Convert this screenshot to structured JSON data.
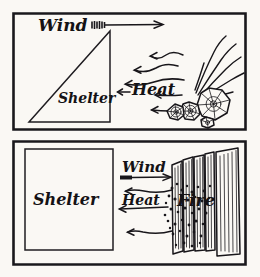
{
  "figure": {
    "background_color": "#faf8f4",
    "ink_color": "#18161a",
    "panel_count": 2
  },
  "panels": [
    {
      "id": "top-panel",
      "name": "lean-to-shelter-with-log-fire",
      "shelter_shape": "triangle",
      "fire_shape": "round-log-ends",
      "labels": {
        "wind": "Wind",
        "shelter": "Shelter",
        "heat": "Heat"
      },
      "arrows": {
        "wind_direction": "right",
        "heat_direction": "left",
        "heat_ray_count": 5
      }
    },
    {
      "id": "bottom-panel",
      "name": "rectangular-shelter-with-upright-log-fire",
      "shelter_shape": "rectangle",
      "fire_shape": "upright-logs",
      "labels": {
        "wind": "Wind",
        "shelter": "Shelter",
        "heat": "Heat",
        "fire": "Fire"
      },
      "arrows": {
        "wind_direction": "right",
        "heat_direction": "left",
        "heat_ray_count": 3
      }
    }
  ]
}
